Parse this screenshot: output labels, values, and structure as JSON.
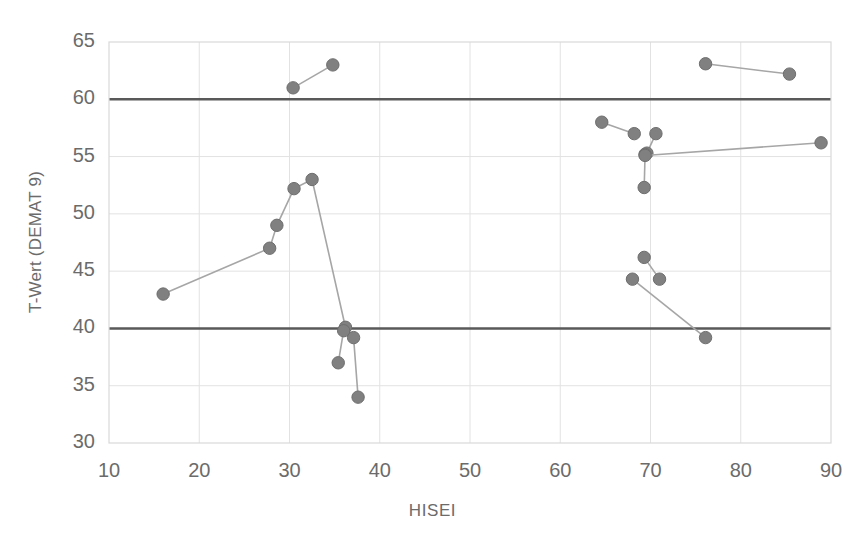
{
  "chart_data": {
    "type": "scatter",
    "title": "",
    "xlabel": "HISEI",
    "ylabel": "T-Wert (DEMAT 9)",
    "xlim": [
      10,
      90
    ],
    "ylim": [
      30,
      65
    ],
    "xticks": [
      10,
      20,
      30,
      40,
      50,
      60,
      70,
      80,
      90
    ],
    "yticks": [
      30,
      35,
      40,
      45,
      50,
      55,
      60,
      65
    ],
    "grid": true,
    "legend": "none",
    "marker_color": "#808080",
    "line_color": "#a6a6a6",
    "reference_line_color": "#595959",
    "reference_lines": [
      {
        "orientation": "horizontal",
        "value": 60
      },
      {
        "orientation": "horizontal",
        "value": 40
      }
    ],
    "series": [
      {
        "name": "segment-1",
        "points": [
          {
            "x": 16.0,
            "y": 43.0
          },
          {
            "x": 27.8,
            "y": 47.0
          },
          {
            "x": 28.6,
            "y": 49.0
          },
          {
            "x": 30.5,
            "y": 52.2
          },
          {
            "x": 32.5,
            "y": 53.0
          },
          {
            "x": 36.2,
            "y": 40.1
          },
          {
            "x": 37.1,
            "y": 39.2
          },
          {
            "x": 37.6,
            "y": 34.0
          }
        ]
      },
      {
        "name": "segment-2",
        "points": [
          {
            "x": 35.4,
            "y": 37.0
          },
          {
            "x": 36.0,
            "y": 39.8
          }
        ]
      },
      {
        "name": "segment-3",
        "points": [
          {
            "x": 30.4,
            "y": 61.0
          },
          {
            "x": 34.8,
            "y": 63.0
          }
        ]
      },
      {
        "name": "segment-4",
        "points": [
          {
            "x": 64.6,
            "y": 58.0
          },
          {
            "x": 68.2,
            "y": 57.0
          }
        ]
      },
      {
        "name": "segment-5",
        "points": [
          {
            "x": 70.6,
            "y": 57.0
          },
          {
            "x": 69.6,
            "y": 55.3
          }
        ]
      },
      {
        "name": "segment-6",
        "points": [
          {
            "x": 69.4,
            "y": 55.2
          },
          {
            "x": 69.3,
            "y": 52.3
          }
        ]
      },
      {
        "name": "segment-7",
        "points": [
          {
            "x": 69.4,
            "y": 55.1
          },
          {
            "x": 88.9,
            "y": 56.2
          }
        ]
      },
      {
        "name": "segment-8",
        "points": [
          {
            "x": 76.1,
            "y": 63.1
          },
          {
            "x": 85.4,
            "y": 62.2
          }
        ]
      },
      {
        "name": "segment-9",
        "points": [
          {
            "x": 69.3,
            "y": 46.2
          },
          {
            "x": 71.0,
            "y": 44.3
          }
        ]
      },
      {
        "name": "segment-10",
        "points": [
          {
            "x": 68.0,
            "y": 44.3
          },
          {
            "x": 76.1,
            "y": 39.2
          }
        ]
      }
    ]
  },
  "axis": {
    "y_title": "T-Wert (DEMAT 9)",
    "x_title": "HISEI",
    "y_tick_labels": [
      "65",
      "60",
      "55",
      "50",
      "45",
      "40",
      "35",
      "30"
    ],
    "x_tick_labels": [
      "10",
      "20",
      "30",
      "40",
      "50",
      "60",
      "70",
      "80",
      "90"
    ]
  }
}
